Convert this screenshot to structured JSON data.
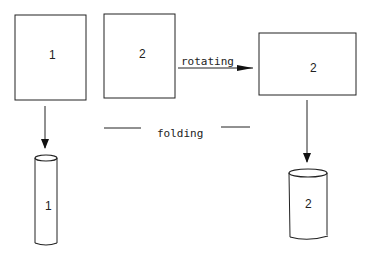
{
  "diagram": {
    "panels": [
      {
        "id": "panel-1",
        "label": "1"
      },
      {
        "id": "panel-2",
        "label": "2"
      },
      {
        "id": "panel-2-rotated",
        "label": "2"
      }
    ],
    "cylinders": [
      {
        "id": "cylinder-1",
        "label": "1"
      },
      {
        "id": "cylinder-2",
        "label": "2"
      }
    ],
    "operations": {
      "rotating": "rotating",
      "folding": "folding"
    },
    "colors": {
      "stroke": "#222222",
      "background": "#ffffff"
    }
  }
}
